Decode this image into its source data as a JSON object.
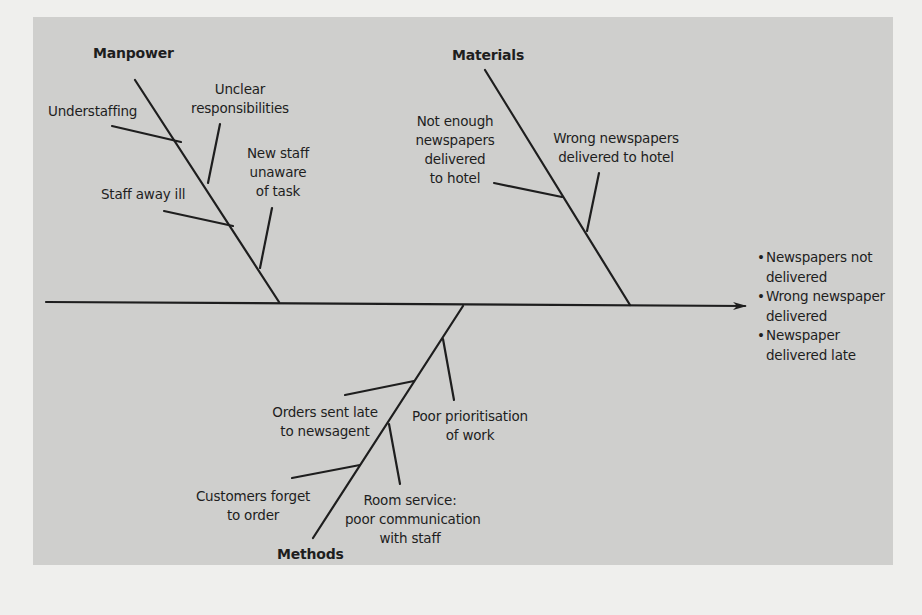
{
  "diagram": {
    "type": "fishbone",
    "colors": {
      "panel": "#cfcfcd",
      "paper": "#efefed",
      "ink": "#1e1e1e"
    },
    "categories": {
      "manpower": {
        "label": "Manpower",
        "causes": [
          "Understaffing",
          "Unclear responsibilities",
          "Staff away ill",
          "New staff unaware of task"
        ]
      },
      "materials": {
        "label": "Materials",
        "causes": [
          "Not enough newspapers delivered to hotel",
          "Wrong newspapers delivered to hotel"
        ]
      },
      "methods": {
        "label": "Methods",
        "causes": [
          "Orders sent late to newsagent",
          "Poor prioritisation of work",
          "Customers forget to order",
          "Room service: poor communication with staff"
        ]
      }
    },
    "labels": {
      "understaffing": "Understaffing",
      "unclear_1": "Unclear",
      "unclear_2": "responsibilities",
      "staff_away": "Staff away ill",
      "new_staff_1": "New staff",
      "new_staff_2": "unaware",
      "new_staff_3": "of task",
      "not_enough_1": "Not enough",
      "not_enough_2": "newspapers",
      "not_enough_3": "delivered",
      "not_enough_4": "to hotel",
      "wrong_1": "Wrong newspapers",
      "wrong_2": "delivered to hotel",
      "orders_1": "Orders sent late",
      "orders_2": "to newsagent",
      "poor_1": "Poor prioritisation",
      "poor_2": "of work",
      "customers_1": "Customers forget",
      "customers_2": "to order",
      "room_1": "Room service:",
      "room_2": "poor communication",
      "room_3": "with staff"
    },
    "effects": {
      "bullet": "•",
      "items": [
        {
          "line1": "Newspapers not",
          "line2": "delivered"
        },
        {
          "line1": "Wrong newspaper",
          "line2": "delivered"
        },
        {
          "line1": "Newspaper",
          "line2": "delivered late"
        }
      ]
    }
  }
}
